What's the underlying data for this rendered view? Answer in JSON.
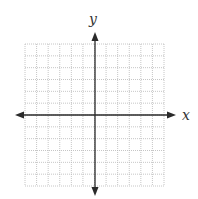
{
  "diagram": {
    "type": "coordinate-plane",
    "grid": {
      "columns": 12,
      "rows": 12,
      "left": 25,
      "top": 44,
      "right": 164,
      "bottom": 186,
      "line_color": "#b8b8b8",
      "line_style": "dotted"
    },
    "origin": {
      "x": 95,
      "y": 115
    },
    "axes": {
      "color": "#2a2a2a",
      "x_axis": {
        "label": "x",
        "from": 15,
        "to": 176,
        "label_x": 182,
        "label_y": 120
      },
      "y_axis": {
        "label": "y",
        "from": 32,
        "to": 196,
        "label_x": 89,
        "label_y": 24
      }
    }
  },
  "colors": {
    "background": "#ffffff",
    "grid": "#b8b8b8",
    "axis": "#2a2a2a",
    "label": "#333333"
  }
}
